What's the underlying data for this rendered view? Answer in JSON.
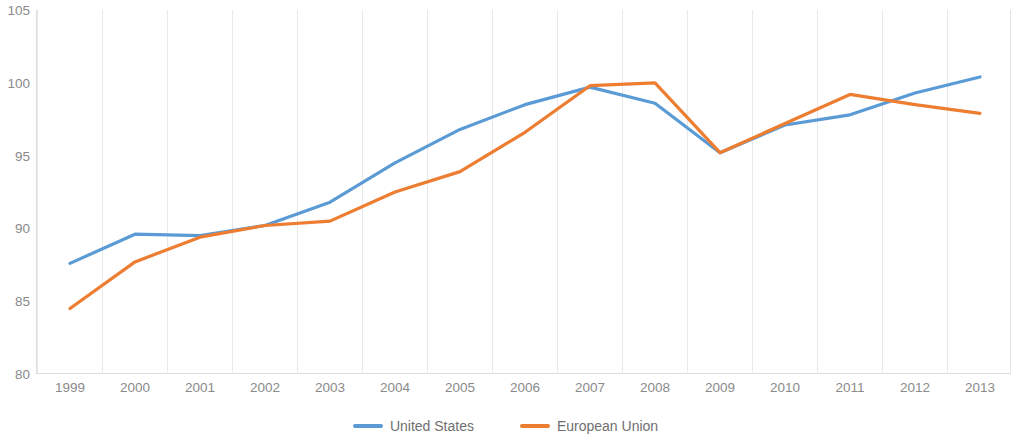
{
  "chart_data": {
    "type": "line",
    "title": "",
    "subtitle": "",
    "xlabel": "",
    "ylabel": "",
    "categories": [
      "1999",
      "2000",
      "2001",
      "2002",
      "2003",
      "2004",
      "2005",
      "2006",
      "2007",
      "2008",
      "2009",
      "2010",
      "2011",
      "2012",
      "2013"
    ],
    "ylim": [
      80,
      105
    ],
    "ytick_labels": [
      "105",
      "100",
      "95",
      "90",
      "85",
      "80"
    ],
    "yticks": [
      105,
      100,
      95,
      90,
      85,
      80
    ],
    "grid": "vertical",
    "legend_position": "bottom-center",
    "series": [
      {
        "name": "United States",
        "color": "#5b9bd5",
        "values": [
          87.6,
          89.6,
          89.5,
          90.2,
          91.8,
          94.5,
          96.8,
          98.5,
          99.7,
          98.6,
          95.2,
          97.1,
          97.8,
          99.3,
          100.4
        ]
      },
      {
        "name": "European Union",
        "color": "#ed7d31",
        "values": [
          84.5,
          87.7,
          89.4,
          90.2,
          90.5,
          92.5,
          93.9,
          96.6,
          99.8,
          100.0,
          95.2,
          97.2,
          99.2,
          98.5,
          97.9
        ]
      }
    ]
  },
  "legend": {
    "items": [
      {
        "label": "United States",
        "color": "#5b9bd5"
      },
      {
        "label": "European Union",
        "color": "#ed7d31"
      }
    ]
  }
}
